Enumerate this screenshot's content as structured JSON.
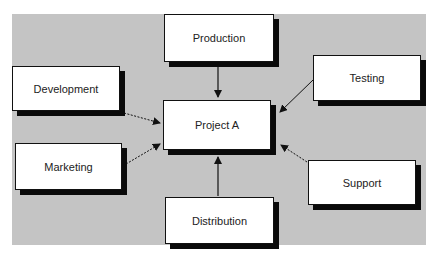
{
  "diagram": {
    "center": {
      "label": "Project A"
    },
    "nodes": [
      {
        "id": "production",
        "label": "Production"
      },
      {
        "id": "development",
        "label": "Development"
      },
      {
        "id": "testing",
        "label": "Testing"
      },
      {
        "id": "marketing",
        "label": "Marketing"
      },
      {
        "id": "support",
        "label": "Support"
      },
      {
        "id": "distribution",
        "label": "Distribution"
      }
    ],
    "edges": [
      {
        "from": "production",
        "to": "project-a",
        "style": "solid"
      },
      {
        "from": "development",
        "to": "project-a",
        "style": "dashed"
      },
      {
        "from": "testing",
        "to": "project-a",
        "style": "solid"
      },
      {
        "from": "marketing",
        "to": "project-a",
        "style": "dashed"
      },
      {
        "from": "support",
        "to": "project-a",
        "style": "dashed"
      },
      {
        "from": "distribution",
        "to": "project-a",
        "style": "solid"
      }
    ],
    "colors": {
      "background": "#c4c4c4",
      "box": "#ffffff",
      "shadow": "#0a0a0a"
    }
  }
}
